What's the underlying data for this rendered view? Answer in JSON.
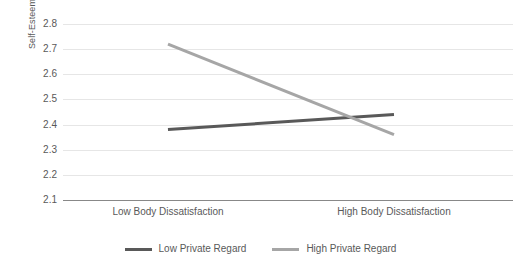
{
  "chart_data": {
    "type": "line",
    "title": "",
    "subtitle": "",
    "xlabel": "",
    "ylabel": "Self-Esteem",
    "categories": [
      "Low Body Dissatisfaction",
      "High Body Dissatisfaction"
    ],
    "series": [
      {
        "name": "Low Private Regard",
        "values": [
          2.38,
          2.44
        ],
        "color": "#595959"
      },
      {
        "name": "High Private Regard",
        "values": [
          2.72,
          2.36
        ],
        "color": "#a6a6a6"
      }
    ],
    "ylim": [
      2.1,
      2.8
    ],
    "ytick_step": 0.1,
    "ytick_labels": [
      "2.8",
      "2.7",
      "2.6",
      "2.5",
      "2.4",
      "2.3",
      "2.2",
      "2.1"
    ],
    "ytick_values": [
      2.8,
      2.7,
      2.6,
      2.5,
      2.4,
      2.3,
      2.2,
      2.1
    ],
    "grid": true,
    "grid_color": "#e6e6e6",
    "axis_color": "#888888",
    "legend_position": "bottom",
    "background_color": "#ffffff",
    "text_color": "#595959"
  },
  "legend": {
    "items": [
      {
        "label": "Low Private Regard"
      },
      {
        "label": "High Private Regard"
      }
    ]
  }
}
